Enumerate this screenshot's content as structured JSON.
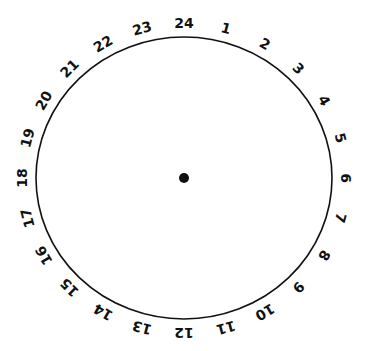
{
  "diagram": {
    "type": "24-hour-clock-face",
    "center": {
      "x": 184,
      "y": 178
    },
    "radius_x": 148,
    "radius_y": 141,
    "label_offset": 14,
    "stroke_color": "#111111",
    "center_dot_radius": 5,
    "hours": [
      "24",
      "1",
      "2",
      "3",
      "4",
      "5",
      "6",
      "7",
      "8",
      "9",
      "10",
      "11",
      "12",
      "13",
      "14",
      "15",
      "16",
      "17",
      "18",
      "19",
      "20",
      "21",
      "22",
      "23"
    ]
  }
}
